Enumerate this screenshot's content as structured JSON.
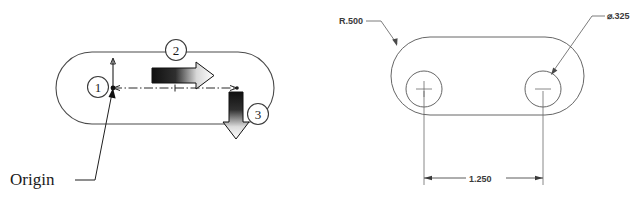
{
  "figure": {
    "background_color": "#ffffff",
    "line_color": "#4a4a4a",
    "text_color": "#1a1a1a"
  },
  "left_view": {
    "name": "callout-view",
    "origin_label": "Origin",
    "callouts": [
      {
        "id": "1",
        "label": "1"
      },
      {
        "id": "2",
        "label": "2"
      },
      {
        "id": "3",
        "label": "3"
      }
    ],
    "arrows": [
      {
        "name": "horizontal-gradient-arrow",
        "direction": "right",
        "gradient_from": "#1a1a1a",
        "gradient_to": "#ffffff"
      },
      {
        "name": "vertical-gradient-arrow",
        "direction": "down",
        "gradient_from": "#1a1a1a",
        "gradient_to": "#ffffff"
      }
    ]
  },
  "right_view": {
    "name": "dimensioned-view",
    "dimensions": [
      {
        "name": "corner-radius",
        "label": "R.500"
      },
      {
        "name": "hole-diameter",
        "label": "⌀.325"
      },
      {
        "name": "hole-spacing",
        "label": "1.250"
      }
    ]
  }
}
